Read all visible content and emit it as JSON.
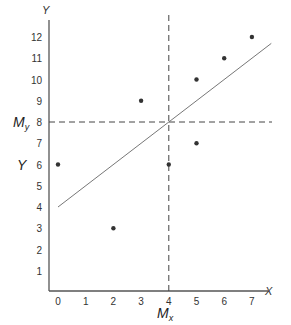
{
  "chart_data": {
    "type": "scatter",
    "title": "",
    "xlabel": "X",
    "ylabel": "Y",
    "xlim": [
      0,
      7.8
    ],
    "ylim": [
      0,
      12.5
    ],
    "x_ticks": [
      0,
      1,
      2,
      3,
      4,
      5,
      6,
      7
    ],
    "y_ticks": [
      1,
      2,
      3,
      4,
      5,
      6,
      7,
      8,
      9,
      10,
      11,
      12
    ],
    "grid": false,
    "series": [
      {
        "name": "data points",
        "points": [
          {
            "x": 0,
            "y": 6
          },
          {
            "x": 2,
            "y": 3
          },
          {
            "x": 3,
            "y": 9
          },
          {
            "x": 4,
            "y": 6
          },
          {
            "x": 5,
            "y": 10
          },
          {
            "x": 5,
            "y": 7
          },
          {
            "x": 6,
            "y": 11
          },
          {
            "x": 7,
            "y": 12
          }
        ]
      }
    ],
    "regression_line": {
      "intercept": 4,
      "slope": 1,
      "x_start": 0,
      "x_end": 7.7
    },
    "mean_lines": {
      "Mx": 4,
      "My": 8,
      "style": "dashed"
    },
    "annotations": [
      {
        "text": "M",
        "subscript": "y",
        "at": "y=8 left of axis"
      },
      {
        "text": "Y",
        "at": "y=6 left of axis"
      },
      {
        "text": "M",
        "subscript": "x",
        "at": "x=4 below axis"
      }
    ]
  },
  "labels": {
    "x_axis": "X",
    "y_axis": "Y",
    "y_side_label": "Y",
    "my_main": "M",
    "my_sub": "y",
    "mx_main": "M",
    "mx_sub": "x"
  },
  "colors": {
    "axis": "#555555",
    "point": "#333333",
    "line": "#777777",
    "dash": "#444444"
  }
}
